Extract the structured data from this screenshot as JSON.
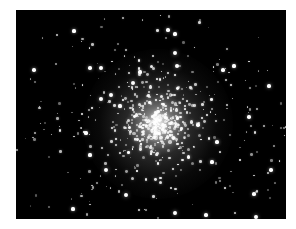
{
  "image": {
    "subject": "globular star cluster",
    "background": "#000000",
    "frame": {
      "left": 16,
      "top": 10,
      "width": 270,
      "height": 209
    },
    "core": {
      "cx": 142,
      "cy": 114,
      "radius": 75
    },
    "bright_stars": [
      [
        152,
        20
      ],
      [
        159,
        24
      ],
      [
        58,
        21
      ],
      [
        18,
        60
      ],
      [
        85,
        58
      ],
      [
        74,
        58
      ],
      [
        159,
        43
      ],
      [
        218,
        56
      ],
      [
        233,
        107
      ],
      [
        70,
        123
      ],
      [
        85,
        89
      ],
      [
        95,
        85
      ],
      [
        207,
        60
      ],
      [
        196,
        152
      ],
      [
        238,
        184
      ],
      [
        90,
        160
      ],
      [
        110,
        185
      ],
      [
        159,
        203
      ],
      [
        190,
        205
      ],
      [
        57,
        199
      ],
      [
        240,
        207
      ],
      [
        161,
        56
      ],
      [
        124,
        62
      ],
      [
        117,
        73
      ],
      [
        253,
        76
      ],
      [
        201,
        132
      ],
      [
        182,
        115
      ],
      [
        104,
        96
      ],
      [
        74,
        145
      ],
      [
        255,
        160
      ]
    ]
  }
}
